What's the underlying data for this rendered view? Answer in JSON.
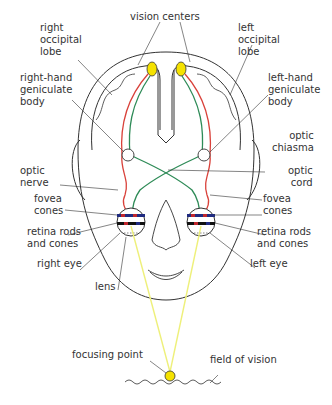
{
  "diagram": {
    "labels": {
      "vision_centers": "vision centers",
      "right_occipital_lobe": "right\noccipital\nlobe",
      "left_occipital_lobe": "left\noccipital\nlobe",
      "right_hand_geniculate_body": "right-hand\ngeniculate\nbody",
      "left_hand_geniculate_body": "left-hand\ngeniculate\nbody",
      "optic_chiasma": "optic\nchiasma",
      "optic_nerve": "optic\nnerve",
      "optic_cord": "optic\ncord",
      "fovea_cones_right": "fovea\ncones",
      "fovea_cones_left": "fovea\ncones",
      "retina_right": "retina rods\nand cones",
      "retina_left": "retina rods\nand cones",
      "right_eye": "right eye",
      "left_eye": "left eye",
      "lens": "lens",
      "focusing_point": "focusing point",
      "field_of_vision": "field of vision"
    },
    "colors": {
      "outline": "#333333",
      "red_pathway": "#d9413a",
      "green_pathway": "#2e8b57",
      "vision_center_fill": "#f5e200",
      "light_ray": "#eef07a",
      "retina_blue": "#1f2a80",
      "retina_red": "#c0272d",
      "retina_black": "#111111"
    }
  }
}
